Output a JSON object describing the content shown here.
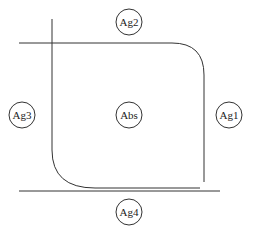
{
  "diagram": {
    "nodes": {
      "ag1": {
        "label": "Ag1",
        "cx": 229,
        "cy": 115
      },
      "ag2": {
        "label": "Ag2",
        "cx": 129,
        "cy": 22
      },
      "ag3": {
        "label": "Ag3",
        "cx": 22,
        "cy": 115
      },
      "ag4": {
        "label": "Ag4",
        "cx": 129,
        "cy": 212
      },
      "abs": {
        "label": "Abs",
        "cx": 129,
        "cy": 115
      }
    },
    "colors": {
      "stroke": "#333333",
      "background": "#ffffff"
    }
  }
}
